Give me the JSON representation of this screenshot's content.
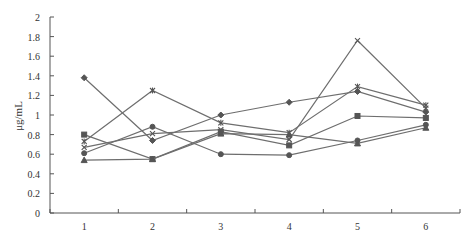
{
  "chart_data": {
    "type": "line",
    "title": "",
    "caption": "",
    "xlabel": "",
    "ylabel": "μg/mL",
    "ylim": [
      0,
      2
    ],
    "yticks": [
      "0",
      "0.2",
      "0.4",
      "0.6",
      "0.8",
      "1",
      "1.2",
      "1.4",
      "1.6",
      "1.8",
      "2"
    ],
    "categories": [
      "1",
      "2",
      "3",
      "4",
      "5",
      "6"
    ],
    "grid": false,
    "legend": "none",
    "series": [
      {
        "name": "Series 1",
        "marker": "diamond",
        "values": [
          1.38,
          0.74,
          1.0,
          1.13,
          1.24,
          1.03
        ]
      },
      {
        "name": "Series 2",
        "marker": "star",
        "values": [
          0.73,
          1.25,
          0.92,
          0.82,
          1.29,
          1.1
        ]
      },
      {
        "name": "Series 3",
        "marker": "x",
        "values": [
          0.67,
          0.81,
          0.85,
          0.75,
          1.76,
          1.07
        ]
      },
      {
        "name": "Series 4",
        "marker": "square",
        "values": [
          0.8,
          0.55,
          0.83,
          0.69,
          0.99,
          0.97
        ]
      },
      {
        "name": "Series 5",
        "marker": "triangle",
        "values": [
          0.54,
          0.55,
          0.81,
          0.8,
          0.71,
          0.87
        ]
      },
      {
        "name": "Series 6",
        "marker": "circle",
        "values": [
          0.61,
          0.88,
          0.6,
          0.59,
          0.74,
          0.9
        ]
      }
    ],
    "colors": {
      "line": "#6e6e6e",
      "axis": "#555555",
      "text": "#333333"
    }
  }
}
